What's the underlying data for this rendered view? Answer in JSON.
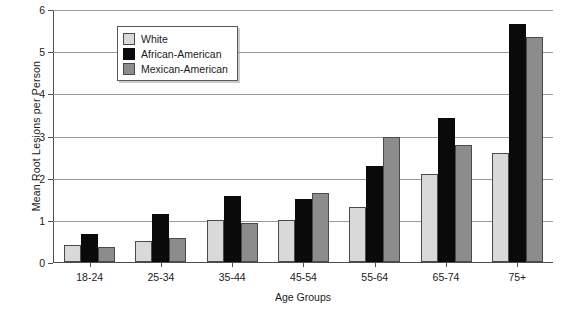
{
  "chart_data": {
    "type": "bar",
    "title": "",
    "xlabel": "Age Groups",
    "ylabel": "Mean Root Lesions per Person",
    "categories": [
      "18-24",
      "25-34",
      "35-44",
      "45-54",
      "55-64",
      "65-74",
      "75+"
    ],
    "series": [
      {
        "name": "White",
        "color": "#d9d9d9",
        "values": [
          0.4,
          0.5,
          1.0,
          1.0,
          1.32,
          2.1,
          2.6
        ]
      },
      {
        "name": "African-American",
        "color": "#0a0a0a",
        "values": [
          0.67,
          1.15,
          1.56,
          1.5,
          2.28,
          3.42,
          5.66
        ]
      },
      {
        "name": "Mexican-American",
        "color": "#8c8c8c",
        "values": [
          0.36,
          0.56,
          0.92,
          1.65,
          2.97,
          2.78,
          5.35
        ]
      }
    ],
    "ylim": [
      0,
      6
    ],
    "yticks": [
      0,
      1,
      2,
      3,
      4,
      5,
      6
    ],
    "ytick_labels": [
      "0",
      "1",
      "2",
      "3",
      "4",
      "5",
      "6"
    ],
    "grid": true,
    "legend_position": "top-left"
  },
  "bottom_caption": ""
}
